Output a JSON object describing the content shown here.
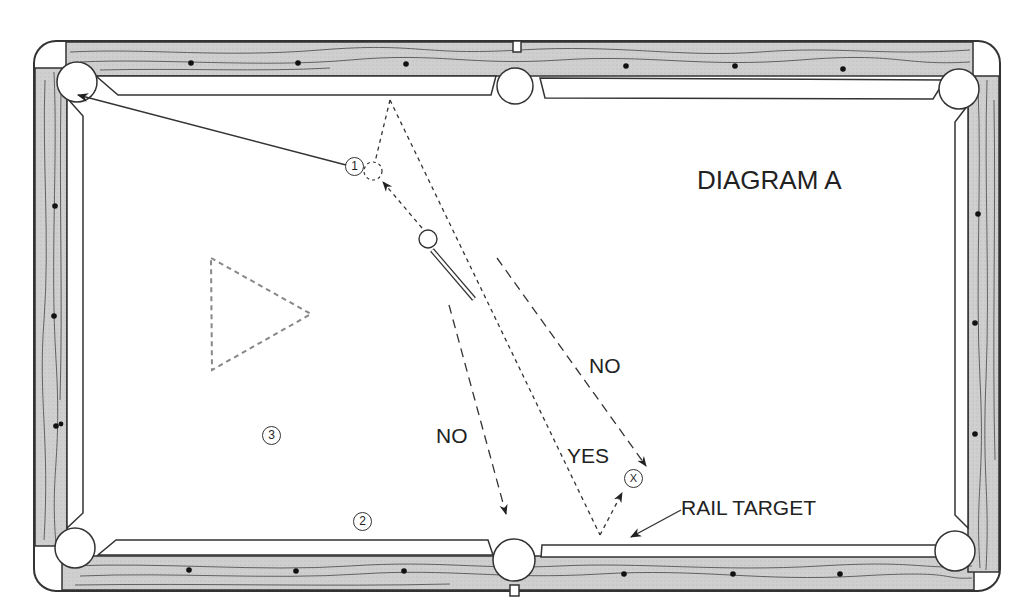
{
  "diagram": {
    "title": "DIAGRAM A",
    "labels": {
      "no_upper": "NO",
      "no_lower": "NO",
      "yes": "YES",
      "rail_target": "RAIL TARGET"
    },
    "balls": {
      "ball_1": "1",
      "ball_2": "2",
      "ball_3": "3",
      "target_x": "X"
    },
    "colors": {
      "rail_wood": "#c8c8c8",
      "outline": "#333333",
      "cloth": "#ffffff",
      "dashed_rack": "#888888"
    }
  }
}
